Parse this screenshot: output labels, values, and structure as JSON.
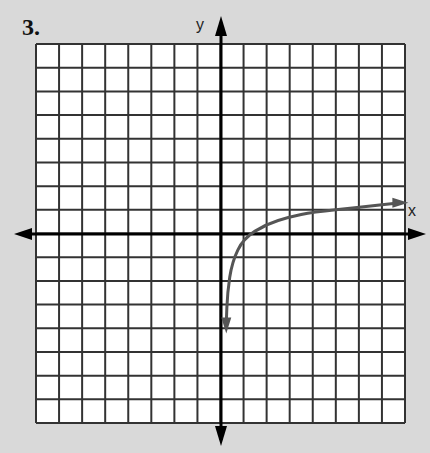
{
  "problem_number": "3.",
  "axes": {
    "x_label": "x",
    "y_label": "y"
  },
  "grid": {
    "columns": 16,
    "rows": 16,
    "x_range": [
      -8,
      8
    ],
    "y_range": [
      -8,
      8
    ],
    "unit": 1
  },
  "colors": {
    "background": "#d9d9d9",
    "grid_fill": "#ffffff",
    "grid_line": "#333333",
    "axis": "#000000",
    "curve": "#555555"
  },
  "curve": {
    "description": "logarithmic-type curve with vertical asymptote near x=0, arrows at both ends",
    "points": [
      [
        0.25,
        -3.8
      ],
      [
        0.3,
        -2.5
      ],
      [
        0.5,
        -1.2
      ],
      [
        1,
        -0.2
      ],
      [
        2,
        0.4
      ],
      [
        3,
        0.7
      ],
      [
        4,
        0.9
      ],
      [
        6,
        1.1
      ],
      [
        7.8,
        1.3
      ]
    ]
  }
}
